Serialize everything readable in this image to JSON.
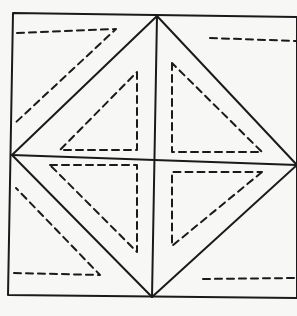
{
  "diagram": {
    "title": "Hand-drawn square with inscribed diamond and dashed triangles",
    "colors": {
      "ink": "#1a1a1a",
      "paper": "#f7f7f5"
    },
    "outer_square": {
      "points": "13,13 297,17 297,298 8,295"
    },
    "diamond": {
      "points": "157,16 297,165 152,297 12,155"
    },
    "horizontal_midline": {
      "x1": 12,
      "y1": 155,
      "x2": 297,
      "y2": 165
    },
    "vertical_midline": {
      "x1": 157,
      "y1": 16,
      "x2": 152,
      "y2": 297
    },
    "dashed_triangles": [
      {
        "name": "top-left-corner",
        "points": "17,33 116,29 14,124"
      },
      {
        "name": "bottom-left-corner",
        "points": "14,273 100,275 16,188"
      },
      {
        "name": "top-right-corner",
        "points": "210,38 297,41 297,130"
      },
      {
        "name": "bottom-right-corner",
        "points": "203,279 297,278 297,200"
      },
      {
        "name": "upper-left-inner",
        "points": "137,72 137,150 60,150"
      },
      {
        "name": "lower-left-inner",
        "points": "50,160 137,160 137,252"
      },
      {
        "name": "upper-right-inner",
        "points": "172,63 172,153 262,153"
      },
      {
        "name": "lower-right-inner",
        "points": "262,170 172,246 172,170"
      }
    ]
  }
}
